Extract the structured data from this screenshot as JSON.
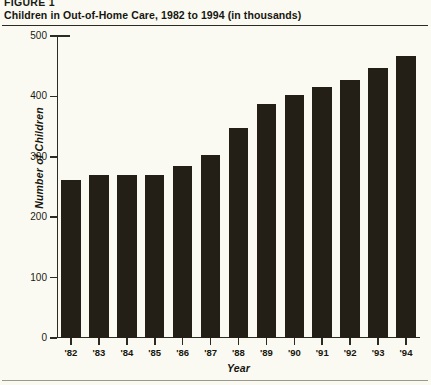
{
  "figure": {
    "label": "FIGURE 1",
    "title": "Children in Out-of-Home Care, 1982 to 1994  (in thousands)"
  },
  "chart_data": {
    "type": "bar",
    "title": "Children in Out-of-Home Care, 1982 to 1994  (in thousands)",
    "xlabel": "Year",
    "ylabel": "Number of Children",
    "categories": [
      "'82",
      "'83",
      "'84",
      "'85",
      "'86",
      "'87",
      "'88",
      "'89",
      "'90",
      "'91",
      "'92",
      "'93",
      "'94"
    ],
    "values": [
      262,
      270,
      270,
      270,
      285,
      303,
      347,
      388,
      402,
      415,
      427,
      447,
      467
    ],
    "ylim": [
      0,
      500
    ],
    "yticks": [
      0,
      100,
      200,
      300,
      400,
      500
    ],
    "ytick_labels": [
      "0",
      "100",
      "200",
      "300",
      "400",
      "500"
    ],
    "grid": false,
    "legend": "none",
    "bar_color": "#231f16",
    "axis_color": "#2b2b22",
    "background_color": "#fbfaf2"
  }
}
